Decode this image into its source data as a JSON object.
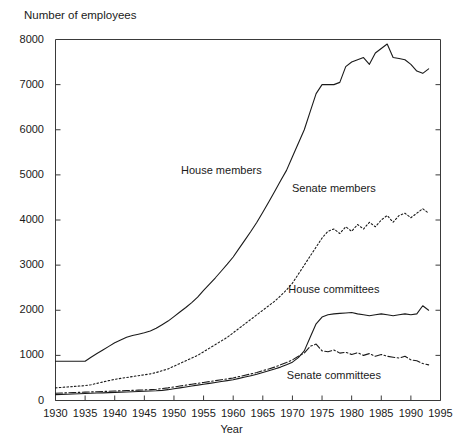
{
  "chart_data": {
    "type": "line",
    "title": "",
    "ylabel": "Number of employees",
    "xlabel": "Year",
    "xlim": [
      1930,
      1995
    ],
    "ylim": [
      0,
      8000
    ],
    "ytick_labels": [
      "0",
      "1000",
      "2000",
      "3000",
      "4000",
      "5000",
      "6000",
      "7000",
      "8000"
    ],
    "yticks": [
      0,
      1000,
      2000,
      3000,
      4000,
      5000,
      6000,
      7000,
      8000
    ],
    "xtick_labels": [
      "1930",
      "1935",
      "1940",
      "1945",
      "1950",
      "1955",
      "1960",
      "1965",
      "1970",
      "1975",
      "1980",
      "1985",
      "1990",
      "1995"
    ],
    "xticks": [
      1930,
      1935,
      1940,
      1945,
      1950,
      1955,
      1960,
      1965,
      1970,
      1975,
      1980,
      1985,
      1990,
      1995
    ],
    "grid": false,
    "legend_position": "inline-annotations",
    "x": [
      1930,
      1931,
      1932,
      1933,
      1934,
      1935,
      1936,
      1937,
      1938,
      1939,
      1940,
      1941,
      1942,
      1943,
      1944,
      1945,
      1946,
      1947,
      1948,
      1949,
      1950,
      1951,
      1952,
      1953,
      1954,
      1955,
      1956,
      1957,
      1958,
      1959,
      1960,
      1961,
      1962,
      1963,
      1964,
      1965,
      1966,
      1967,
      1968,
      1969,
      1970,
      1971,
      1972,
      1973,
      1974,
      1975,
      1976,
      1977,
      1978,
      1979,
      1980,
      1981,
      1982,
      1983,
      1984,
      1985,
      1986,
      1987,
      1988,
      1989,
      1990,
      1991,
      1992,
      1993
    ],
    "series": [
      {
        "name": "House members",
        "line_style": "solid",
        "color": "#1a1a1a",
        "label_x": 1958,
        "label_y": 5100,
        "values": [
          870,
          870,
          870,
          870,
          870,
          870,
          960,
          1040,
          1120,
          1200,
          1280,
          1340,
          1400,
          1440,
          1470,
          1500,
          1540,
          1600,
          1680,
          1760,
          1860,
          1960,
          2060,
          2170,
          2290,
          2440,
          2580,
          2720,
          2870,
          3020,
          3180,
          3370,
          3560,
          3750,
          3950,
          4170,
          4400,
          4630,
          4870,
          5100,
          5400,
          5700,
          6000,
          6400,
          6800,
          7000,
          7000,
          7000,
          7050,
          7400,
          7500,
          7550,
          7600,
          7450,
          7700,
          7800,
          7900,
          7600,
          7580,
          7550,
          7450,
          7300,
          7250,
          7350
        ]
      },
      {
        "name": "Senate members",
        "line_style": "dotted",
        "color": "#1a1a1a",
        "label_x": 1977,
        "label_y": 4700,
        "values": [
          280,
          290,
          300,
          310,
          320,
          330,
          350,
          380,
          410,
          440,
          470,
          490,
          510,
          530,
          550,
          570,
          590,
          620,
          660,
          700,
          760,
          820,
          880,
          940,
          1000,
          1080,
          1160,
          1240,
          1320,
          1400,
          1500,
          1600,
          1700,
          1800,
          1900,
          2000,
          2100,
          2200,
          2320,
          2450,
          2600,
          2800,
          3000,
          3200,
          3400,
          3600,
          3750,
          3800,
          3700,
          3850,
          3750,
          3900,
          3800,
          3950,
          3850,
          4000,
          4100,
          3950,
          4100,
          4150,
          4050,
          4150,
          4250,
          4150
        ]
      },
      {
        "name": "House committees",
        "line_style": "solid",
        "color": "#1a1a1a",
        "label_x": 1977,
        "label_y": 2480,
        "values": [
          130,
          135,
          140,
          145,
          150,
          155,
          160,
          165,
          170,
          175,
          180,
          185,
          190,
          195,
          200,
          205,
          210,
          215,
          225,
          240,
          260,
          280,
          300,
          320,
          340,
          360,
          380,
          400,
          420,
          440,
          460,
          490,
          520,
          550,
          580,
          620,
          660,
          700,
          740,
          790,
          850,
          950,
          1100,
          1400,
          1700,
          1850,
          1900,
          1920,
          1930,
          1940,
          1950,
          1920,
          1900,
          1880,
          1900,
          1920,
          1900,
          1880,
          1900,
          1920,
          1900,
          1920,
          2100,
          2000
        ]
      },
      {
        "name": "Senate committees",
        "line_style": "dashdot",
        "color": "#1a1a1a",
        "label_x": 1977,
        "label_y": 570,
        "values": [
          160,
          165,
          170,
          175,
          180,
          185,
          190,
          195,
          200,
          205,
          210,
          215,
          220,
          225,
          230,
          235,
          240,
          250,
          265,
          280,
          300,
          320,
          340,
          360,
          380,
          400,
          420,
          440,
          460,
          480,
          500,
          530,
          560,
          590,
          620,
          660,
          700,
          740,
          790,
          840,
          900,
          980,
          1050,
          1200,
          1250,
          1100,
          1080,
          1120,
          1050,
          1070,
          1020,
          1060,
          1000,
          1040,
          980,
          1020,
          980,
          960,
          940,
          980,
          900,
          880,
          820,
          790
        ]
      }
    ]
  },
  "axes": {
    "y_title": "Number of employees",
    "x_title": "Year"
  }
}
